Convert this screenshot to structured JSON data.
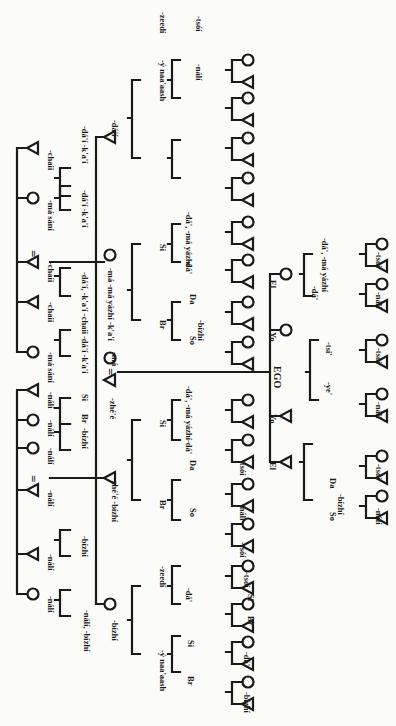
{
  "diagram": {
    "orientation": "generations run left-to-right; labels rotated 90°",
    "symbols": {
      "male": "triangle",
      "female": "circle",
      "marriage": "="
    },
    "ego_label": "EGO",
    "nodes": [
      {
        "id": "pgp1",
        "sex": "m",
        "x": 33,
        "y": 148,
        "label": "-chaii"
      },
      {
        "id": "pgp2",
        "sex": "f",
        "x": 33,
        "y": 198,
        "label": "-má sání"
      },
      {
        "id": "pgp3",
        "sex": "m",
        "x": 33,
        "y": 302,
        "label": "-chaii"
      },
      {
        "id": "pgp4",
        "sex": "m",
        "x": 33,
        "y": 262,
        "label": "-chaii"
      },
      {
        "id": "pgp5",
        "sex": "f",
        "x": 33,
        "y": 352,
        "label": "-má sání"
      },
      {
        "id": "mgp1",
        "sex": "m",
        "x": 33,
        "y": 390,
        "label": "-nálí"
      },
      {
        "id": "mgp2",
        "sex": "f",
        "x": 33,
        "y": 420,
        "label": "-nálí"
      },
      {
        "id": "mgp3",
        "sex": "f",
        "x": 33,
        "y": 448,
        "label": "-nálí"
      },
      {
        "id": "mgp4",
        "sex": "m",
        "x": 33,
        "y": 490,
        "label": "-nálí"
      },
      {
        "id": "mgp5",
        "sex": "m",
        "x": 33,
        "y": 554,
        "label": "-nálí"
      },
      {
        "id": "mgp6",
        "sex": "f",
        "x": 33,
        "y": 594,
        "label": "-nálí"
      },
      {
        "id": "f_si",
        "sex": "m",
        "x": 110,
        "y": 137,
        "label": "-dá'í"
      },
      {
        "id": "mo",
        "sex": "f",
        "x": 110,
        "y": 255,
        "label": "-má yázhí -k'a'í"
      },
      {
        "id": "mo2",
        "sex": "f",
        "x": 110,
        "y": 358,
        "label": "-má"
      },
      {
        "id": "fa",
        "sex": "m",
        "x": 110,
        "y": 380,
        "label": "-zhé'é"
      },
      {
        "id": "fa_br",
        "sex": "m",
        "x": 110,
        "y": 478,
        "label": "-zhé'é -bízhí"
      },
      {
        "id": "fa_si",
        "sex": "f",
        "x": 110,
        "y": 604,
        "label": "-bízhí"
      },
      {
        "id": "e_el",
        "sex": "f",
        "x": 286,
        "y": 274,
        "label": "-ádí"
      },
      {
        "id": "e_yo",
        "sex": "f",
        "x": 286,
        "y": 330,
        "label": "-deezhí"
      },
      {
        "id": "e_yob",
        "sex": "m",
        "x": 286,
        "y": 416,
        "label": "-tsilí"
      },
      {
        "id": "e_elb",
        "sex": "m",
        "x": 286,
        "y": 462,
        "label": "-naaí"
      }
    ],
    "relative_labels": [
      {
        "text": "El",
        "x": 270,
        "y": 280
      },
      {
        "text": "Yo",
        "x": 270,
        "y": 332
      },
      {
        "text": "Yo",
        "x": 270,
        "y": 414
      },
      {
        "text": "El",
        "x": 270,
        "y": 462
      },
      {
        "text": "Si",
        "x": 160,
        "y": 244
      },
      {
        "text": "Br",
        "x": 160,
        "y": 320
      },
      {
        "text": "Si",
        "x": 160,
        "y": 420
      },
      {
        "text": "Br",
        "x": 160,
        "y": 500
      },
      {
        "text": "Si",
        "x": 188,
        "y": 640
      },
      {
        "text": "Br",
        "x": 188,
        "y": 676
      },
      {
        "text": "So",
        "x": 190,
        "y": 336
      },
      {
        "text": "Da",
        "x": 190,
        "y": 294
      },
      {
        "text": "So",
        "x": 190,
        "y": 508
      },
      {
        "text": "Da",
        "x": 190,
        "y": 460
      },
      {
        "text": "So",
        "x": 330,
        "y": 512
      },
      {
        "text": "Da",
        "x": 330,
        "y": 478
      },
      {
        "text": "Br",
        "x": 82,
        "y": 414
      },
      {
        "text": "Si",
        "x": 82,
        "y": 394
      },
      {
        "text": "Br",
        "x": 248,
        "y": 616
      },
      {
        "text": "Si",
        "x": 248,
        "y": 594
      }
    ],
    "term_labels": [
      {
        "text": "-chaii",
        "x": 48,
        "y": 150
      },
      {
        "text": "-má sání",
        "x": 48,
        "y": 200
      },
      {
        "text": "-dá'í  -k'a'í",
        "x": 82,
        "y": 126
      },
      {
        "text": "-dá'í  -k'a'í",
        "x": 82,
        "y": 190
      },
      {
        "text": "-chaii",
        "x": 48,
        "y": 262
      },
      {
        "text": "-chaii",
        "x": 48,
        "y": 302
      },
      {
        "text": "-má sání",
        "x": 48,
        "y": 352
      },
      {
        "text": "-dá'í, -k'a'í -chaii",
        "x": 82,
        "y": 272
      },
      {
        "text": "-dá'í -k'a'í",
        "x": 82,
        "y": 336
      },
      {
        "text": "-dá'í",
        "x": 112,
        "y": 120
      },
      {
        "text": "-má -má yázhí -k'a'í",
        "x": 108,
        "y": 268
      },
      {
        "text": "-má",
        "x": 112,
        "y": 352
      },
      {
        "text": "-zhé'é",
        "x": 110,
        "y": 398
      },
      {
        "text": "-zhé'é -bízhí",
        "x": 112,
        "y": 478
      },
      {
        "text": "-bízhí",
        "x": 112,
        "y": 620
      },
      {
        "text": "-nálí",
        "x": 48,
        "y": 392
      },
      {
        "text": "-bízhí",
        "x": 82,
        "y": 428
      },
      {
        "text": "-nálí",
        "x": 48,
        "y": 420
      },
      {
        "text": "-nálí",
        "x": 48,
        "y": 448
      },
      {
        "text": "-nálí",
        "x": 48,
        "y": 490
      },
      {
        "text": "-bízhí",
        "x": 82,
        "y": 536
      },
      {
        "text": "-nálí",
        "x": 48,
        "y": 554
      },
      {
        "text": "-nálí, -bízhí",
        "x": 84,
        "y": 610
      },
      {
        "text": "-nálí",
        "x": 48,
        "y": 596
      },
      {
        "text": "-ý naa'aash",
        "x": 160,
        "y": 60
      },
      {
        "text": "-zeedí",
        "x": 160,
        "y": 12
      },
      {
        "text": "-nálí",
        "x": 196,
        "y": 64
      },
      {
        "text": "-tsóí",
        "x": 196,
        "y": 16
      },
      {
        "text": "-dá', -má yázhí",
        "x": 186,
        "y": 212
      },
      {
        "text": "-dá'",
        "x": 186,
        "y": 260
      },
      {
        "text": "-bízhí",
        "x": 198,
        "y": 320
      },
      {
        "text": "-dá', -má yázhí",
        "x": 186,
        "y": 386
      },
      {
        "text": "-dá'",
        "x": 186,
        "y": 440
      },
      {
        "text": "-tsóí",
        "x": 240,
        "y": 460
      },
      {
        "text": "-nálí",
        "x": 240,
        "y": 504
      },
      {
        "text": "-tsóí",
        "x": 240,
        "y": 542
      },
      {
        "text": "-zeedí",
        "x": 160,
        "y": 566
      },
      {
        "text": "-dá'",
        "x": 186,
        "y": 588
      },
      {
        "text": "-ý naa'aash",
        "x": 160,
        "y": 650
      },
      {
        "text": "-tsóí",
        "x": 244,
        "y": 572
      },
      {
        "text": "-dá'",
        "x": 244,
        "y": 652
      },
      {
        "text": "-bízhí",
        "x": 244,
        "y": 692
      },
      {
        "text": "-dá', -má yázhí",
        "x": 322,
        "y": 238
      },
      {
        "text": "-dá'",
        "x": 312,
        "y": 286
      },
      {
        "text": "-tsi'",
        "x": 326,
        "y": 342
      },
      {
        "text": "-ye'",
        "x": 326,
        "y": 382
      },
      {
        "text": "-bízhí",
        "x": 338,
        "y": 494
      },
      {
        "text": "-tsóí",
        "x": 376,
        "y": 252
      },
      {
        "text": "-nálí",
        "x": 376,
        "y": 292
      },
      {
        "text": "-tsóí",
        "x": 376,
        "y": 348
      },
      {
        "text": "-nálí",
        "x": 376,
        "y": 402
      },
      {
        "text": "-tsóí",
        "x": 376,
        "y": 464
      },
      {
        "text": "-nálí",
        "x": 376,
        "y": 508
      }
    ],
    "grandchild_pairs": [
      {
        "x": 232,
        "y": 60
      },
      {
        "x": 232,
        "y": 98
      },
      {
        "x": 232,
        "y": 138
      },
      {
        "x": 232,
        "y": 178
      },
      {
        "x": 232,
        "y": 222
      },
      {
        "x": 232,
        "y": 260
      },
      {
        "x": 232,
        "y": 302
      },
      {
        "x": 232,
        "y": 342
      },
      {
        "x": 232,
        "y": 400
      },
      {
        "x": 232,
        "y": 440
      },
      {
        "x": 232,
        "y": 484
      },
      {
        "x": 232,
        "y": 524
      },
      {
        "x": 232,
        "y": 566
      },
      {
        "x": 232,
        "y": 604
      },
      {
        "x": 232,
        "y": 642
      },
      {
        "x": 232,
        "y": 682
      },
      {
        "x": 366,
        "y": 244
      },
      {
        "x": 366,
        "y": 284
      },
      {
        "x": 366,
        "y": 340
      },
      {
        "x": 366,
        "y": 394
      },
      {
        "x": 366,
        "y": 456
      },
      {
        "x": 366,
        "y": 496
      }
    ],
    "marriage_signs": [
      {
        "x": 110,
        "y": 368
      },
      {
        "x": 33,
        "y": 250
      },
      {
        "x": 33,
        "y": 475
      }
    ]
  }
}
